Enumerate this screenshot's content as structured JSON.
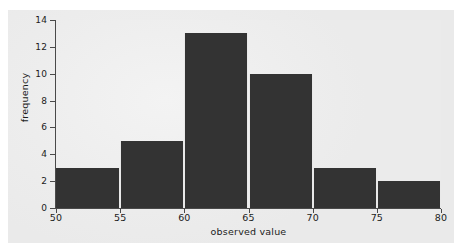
{
  "chart_data": {
    "type": "bar",
    "title": "",
    "xlabel": "observed value",
    "ylabel": "frequency",
    "bin_edges": [
      50,
      55,
      60,
      65,
      70,
      75,
      80
    ],
    "categories": [
      "50-55",
      "55-60",
      "60-65",
      "65-70",
      "70-75",
      "75-80"
    ],
    "values": [
      3,
      5,
      13,
      10,
      3,
      2
    ],
    "xlim": [
      50,
      80
    ],
    "ylim": [
      0,
      14
    ],
    "xticks": [
      "50",
      "55",
      "60",
      "65",
      "70",
      "75",
      "80"
    ],
    "yticks": [
      "0",
      "2",
      "4",
      "6",
      "8",
      "10",
      "12",
      "14"
    ],
    "grid": false,
    "legend": false,
    "bar_color": "#333333",
    "bar_edge_color": "#e9e9e9",
    "axis_color": "#4a4a4a",
    "plot_background": "#ededed",
    "figure_background": "#ececec",
    "text_color": "#1b1b1b"
  }
}
